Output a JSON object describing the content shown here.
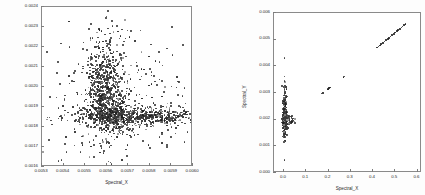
{
  "figure": {
    "background_color": "#fdfdfd",
    "frame_color": "#8a8a8a",
    "point_color": "#3a3a3a"
  },
  "chart_data": [
    {
      "id": "left-scatter",
      "type": "scatter",
      "title": "",
      "xlabel": "Spectral_X",
      "ylabel": "",
      "xlim": [
        0.0053,
        0.006
      ],
      "ylim": [
        0.0016,
        0.0024
      ],
      "xticklabels": [
        "0.0053",
        "0.0054",
        "0.0055",
        "0.0056",
        "0.0057",
        "0.0058",
        "0.0059",
        "0.0060"
      ],
      "xticks": [
        0.0053,
        0.0054,
        0.0055,
        0.0056,
        0.0057,
        0.0058,
        0.0059,
        0.006
      ],
      "yticklabels": [
        "0.0016",
        "0.0017",
        "0.0018",
        "0.0019",
        "0.0020",
        "0.0021",
        "0.0022",
        "0.0023",
        "0.0024"
      ],
      "yticks": [
        0.0016,
        0.0017,
        0.0018,
        0.0019,
        0.002,
        0.0021,
        0.0022,
        0.0023,
        0.0024
      ],
      "grid": false,
      "legend": null,
      "marker": "point",
      "description": "Dense L-shaped cloud: a vertical plume near x=0.00560 spanning y=0.00180-0.00215 and a horizontal band near y=0.00185 extending to x=0.0060, with sparse outliers",
      "n_points": 1800,
      "clusters": [
        {
          "name": "vertical-plume",
          "cx": 0.005595,
          "cy": 0.002005,
          "sx": 4.8e-05,
          "sy": 0.000125,
          "n": 620
        },
        {
          "name": "horizontal-band",
          "cx": 0.005735,
          "cy": 0.0018525,
          "sx": 0.000165,
          "sy": 2.2e-05,
          "n": 640
        },
        {
          "name": "core-knot",
          "cx": 0.005625,
          "cy": 0.00187,
          "sx": 4e-05,
          "sy": 4.8e-05,
          "n": 300
        },
        {
          "name": "scatter-halo",
          "cx": 0.00564,
          "cy": 0.00193,
          "sx": 0.000165,
          "sy": 0.000175,
          "n": 240
        }
      ],
      "outliers": [
        [
          0.005377,
          0.001629
        ],
        [
          0.00539,
          0.001635
        ],
        [
          0.005414,
          0.001674
        ],
        [
          0.00545,
          0.001708
        ],
        [
          0.005478,
          0.001676
        ],
        [
          0.005333,
          0.001736
        ],
        [
          0.005605,
          0.00238
        ],
        [
          0.005625,
          0.00233
        ],
        [
          0.005648,
          0.002305
        ],
        [
          0.005598,
          0.002345
        ],
        [
          0.00567,
          0.002288
        ],
        [
          0.005712,
          0.00228
        ],
        [
          0.005955,
          0.00221
        ],
        [
          0.005905,
          0.00216
        ],
        [
          0.005845,
          0.002125
        ],
        [
          0.0058,
          0.00209
        ],
        [
          0.00596,
          0.001995
        ],
        [
          0.00593,
          0.00196
        ],
        [
          0.005515,
          0.002145
        ],
        [
          0.00547,
          0.002115
        ],
        [
          0.00544,
          0.00203
        ],
        [
          0.005405,
          0.00194
        ],
        [
          0.00539,
          0.001835
        ],
        [
          0.00545,
          0.00179
        ],
        [
          0.00596,
          0.001725
        ],
        [
          0.00588,
          0.00171
        ],
        [
          0.0058,
          0.001695
        ],
        [
          0.00569,
          0.001688
        ],
        [
          0.005575,
          0.001695
        ],
        [
          0.00552,
          0.001725
        ]
      ]
    },
    {
      "id": "right-scatter",
      "type": "scatter",
      "title": "",
      "xlabel": "Spectral_X",
      "ylabel": "Spectral_Y",
      "xlim": [
        -0.045,
        0.62
      ],
      "ylim": [
        0.0,
        0.006
      ],
      "xticklabels": [
        "0.0",
        "0.1",
        "0.2",
        "0.3",
        "0.4",
        "0.5",
        "0.6"
      ],
      "xticks": [
        0.0,
        0.1,
        0.2,
        0.3,
        0.4,
        0.5,
        0.6
      ],
      "yticklabels": [
        "0.000",
        "0.001",
        "0.002",
        "0.003",
        "0.004",
        "0.005",
        "0.006"
      ],
      "yticks": [
        0.0,
        0.001,
        0.002,
        0.003,
        0.004,
        0.005,
        0.006
      ],
      "grid": false,
      "legend": null,
      "marker": "point",
      "description": "Tall narrow dense column at x=0 spanning y=0.0014-0.0025 plus a sparse rising diagonal trail from (0.17,0.0030) to (0.53,0.0055)",
      "n_points": 430,
      "clusters": [
        {
          "name": "x0-column",
          "cx": 0.004,
          "cy": 0.00197,
          "sx": 0.0055,
          "sy": 0.0003,
          "n": 280
        },
        {
          "name": "x0-tail-up",
          "cx": 0.004,
          "cy": 0.00275,
          "sx": 0.0045,
          "sy": 0.0003,
          "n": 40
        },
        {
          "name": "side-spur",
          "cx": 0.03,
          "cy": 0.00198,
          "sx": 0.009,
          "sy": 0.0001,
          "n": 30
        }
      ],
      "diagonal_trail": [
        [
          0.168,
          0.00298
        ],
        [
          0.176,
          0.003
        ],
        [
          0.195,
          0.00314
        ],
        [
          0.199,
          0.00316
        ],
        [
          0.203,
          0.00318
        ],
        [
          0.207,
          0.0032
        ],
        [
          0.268,
          0.0036
        ],
        [
          0.272,
          0.00362
        ],
        [
          0.418,
          0.0047
        ],
        [
          0.424,
          0.00474
        ],
        [
          0.43,
          0.00478
        ],
        [
          0.437,
          0.00483
        ],
        [
          0.444,
          0.00488
        ],
        [
          0.452,
          0.00493
        ],
        [
          0.459,
          0.00498
        ],
        [
          0.466,
          0.00503
        ],
        [
          0.472,
          0.00507
        ],
        [
          0.479,
          0.00512
        ],
        [
          0.486,
          0.00517
        ],
        [
          0.493,
          0.00522
        ],
        [
          0.5,
          0.00527
        ],
        [
          0.507,
          0.00532
        ],
        [
          0.513,
          0.00536
        ],
        [
          0.52,
          0.00541
        ],
        [
          0.527,
          0.00546
        ],
        [
          0.533,
          0.0055
        ],
        [
          0.54,
          0.00555
        ],
        [
          0.546,
          0.00558
        ]
      ],
      "outliers": [
        [
          0.002,
          0.00432
        ],
        [
          0.003,
          0.00344
        ],
        [
          0.004,
          0.00328
        ],
        [
          0.002,
          0.00316
        ],
        [
          0.005,
          0.00305
        ],
        [
          0.003,
          0.00291
        ],
        [
          0.004,
          0.00122
        ],
        [
          0.002,
          0.00048
        ]
      ]
    }
  ]
}
